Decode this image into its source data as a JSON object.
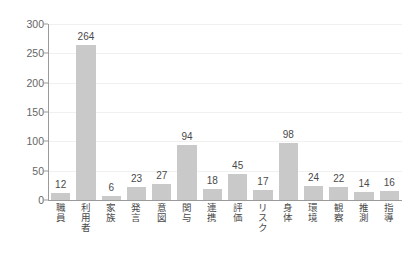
{
  "chart_data": {
    "type": "bar",
    "title": "",
    "subtitle": "",
    "xlabel": "",
    "ylabel": "",
    "ylim": [
      0,
      300
    ],
    "yticks": [
      0,
      50,
      100,
      150,
      200,
      250,
      300
    ],
    "grid": true,
    "legend": false,
    "legend_position": "none",
    "bar_color": "#c9c9c9",
    "axis_color": "#9a9a9a",
    "gridline_color": "#f0f0f0",
    "label_color": "#4a4a4a",
    "tick_color": "#666666",
    "categories": [
      "職員",
      "利用者",
      "家族",
      "発言",
      "意図",
      "関与",
      "連携",
      "評価",
      "リスク",
      "身体",
      "環境",
      "観察",
      "推測",
      "指導"
    ],
    "values": [
      12,
      264,
      6,
      23,
      27,
      94,
      18,
      45,
      17,
      98,
      24,
      22,
      14,
      16
    ],
    "data_labels": [
      "12",
      "264",
      "6",
      "23",
      "27",
      "94",
      "18",
      "45",
      "17",
      "98",
      "24",
      "22",
      "14",
      "16"
    ]
  }
}
